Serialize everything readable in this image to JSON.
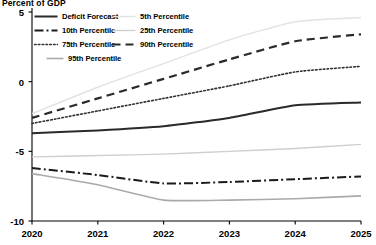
{
  "chart_title": "Percent of GDP",
  "chart_data": {
    "type": "line",
    "title": "Percent of GDP",
    "xlabel": "",
    "ylabel": "Percent of GDP",
    "x": [
      2020,
      2021,
      2022,
      2023,
      2024,
      2025
    ],
    "xlim": [
      2020,
      2025
    ],
    "ylim": [
      -10,
      5
    ],
    "yticks": [
      5,
      0,
      -5,
      -10
    ],
    "xticks": [
      2020,
      2021,
      2022,
      2023,
      2024,
      2025
    ],
    "grid": false,
    "legend_position": "top-left",
    "series": [
      {
        "name": "Deficit Forecast",
        "style": "solid",
        "color": "#2a2a2a",
        "width": 2.0,
        "values": [
          -3.7,
          -3.5,
          -3.2,
          -2.6,
          -1.7,
          -1.5
        ]
      },
      {
        "name": "5th Percentile",
        "style": "dotted-light",
        "color": "#e2e2e2",
        "width": 1.4,
        "values": [
          -2.3,
          -0.4,
          1.3,
          3.0,
          4.3,
          4.6
        ]
      },
      {
        "name": "10th Percentile",
        "style": "dash-dot",
        "color": "#1a1a1a",
        "width": 2.0,
        "values": [
          -6.2,
          -6.7,
          -7.3,
          -7.2,
          -7.0,
          -6.8
        ]
      },
      {
        "name": "25th Percentile",
        "style": "solid-gray",
        "color": "#cfcfcf",
        "width": 1.4,
        "values": [
          -5.4,
          -5.3,
          -5.2,
          -5.0,
          -4.8,
          -4.5
        ]
      },
      {
        "name": "75th Percentile",
        "style": "dotted",
        "color": "#303030",
        "width": 1.6,
        "values": [
          -3.0,
          -2.1,
          -1.2,
          -0.3,
          0.7,
          1.1
        ]
      },
      {
        "name": "90th Percentile",
        "style": "dashed",
        "color": "#2a2a2a",
        "width": 2.2,
        "values": [
          -2.6,
          -1.2,
          0.2,
          1.6,
          2.9,
          3.4
        ]
      },
      {
        "name": "95th Percentile",
        "style": "solid-gray2",
        "color": "#aaaaaa",
        "width": 1.6,
        "values": [
          -6.6,
          -7.4,
          -8.5,
          -8.5,
          -8.4,
          -8.2
        ]
      }
    ]
  },
  "legend": {
    "items": [
      {
        "label": "Deficit Forecast",
        "key": "solid"
      },
      {
        "label": "5th Percentile",
        "key": "dotted-light"
      },
      {
        "label": "10th Percentile",
        "key": "dash-dot"
      },
      {
        "label": "25th Percentile",
        "key": "solid-gray"
      },
      {
        "label": "75th Percentile",
        "key": "dotted"
      },
      {
        "label": "90th Percentile",
        "key": "dashed"
      },
      {
        "label": "95th Percentile",
        "key": "solid-gray2"
      }
    ]
  },
  "axes": {
    "y_tick_labels": [
      "5",
      "0",
      "-5",
      "-10"
    ],
    "x_tick_labels": [
      "2020",
      "2021",
      "2022",
      "2023",
      "2024",
      "2025"
    ]
  }
}
